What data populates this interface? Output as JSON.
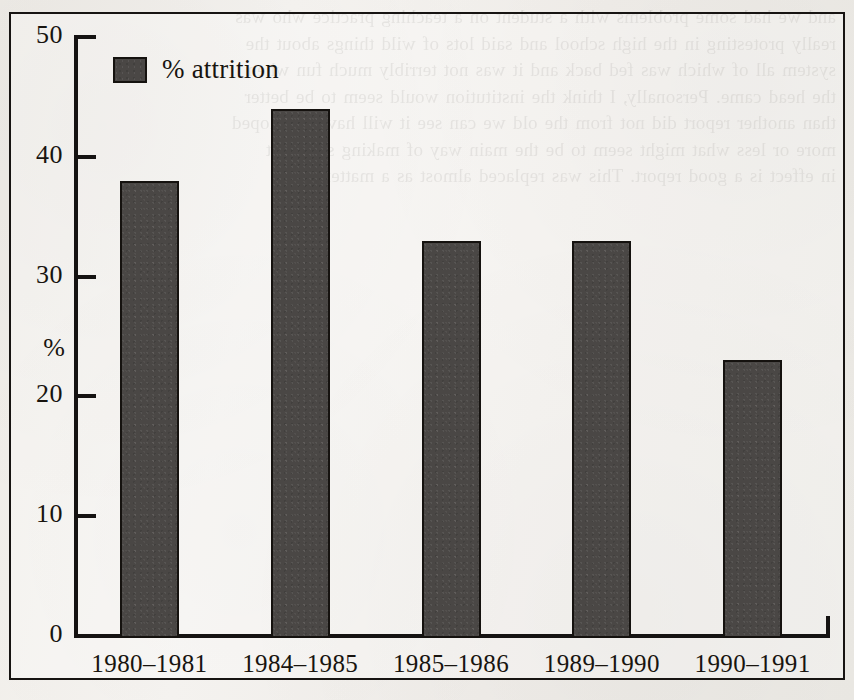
{
  "figure": {
    "legend": {
      "swatch_color": "#4a4745",
      "label": "% attrition"
    },
    "y_axis_title": "%"
  },
  "showthrough_text": "and we had some problems with a student on a teaching practice who was\nreally protesting in the high school and said lots of wild things about the\nsystem all of which was fed back and it was not terribly much fun when\nthe head came. Personally, I think the institution would seem to be better\nthan another report did not from the old we can see it will have developed\nmore or less what might seem to be the main way of making sure that\nin effect is a good report. This was replaced almost as a matter of",
  "chart_data": {
    "type": "bar",
    "title": "",
    "xlabel": "",
    "ylabel": "%",
    "ylim": [
      0,
      50
    ],
    "yticks": [
      0,
      10,
      20,
      30,
      40,
      50
    ],
    "ytick_labels": [
      "0",
      "10",
      "20",
      "30",
      "40",
      "50"
    ],
    "grid": false,
    "legend_position": "upper-left-inside",
    "categories": [
      "1980–1981",
      "1984–1985",
      "1985–1986",
      "1989–1990",
      "1990–1991"
    ],
    "series": [
      {
        "name": "% attrition",
        "color": "#4a4745",
        "values": [
          38,
          44,
          33,
          33,
          23
        ]
      }
    ]
  }
}
